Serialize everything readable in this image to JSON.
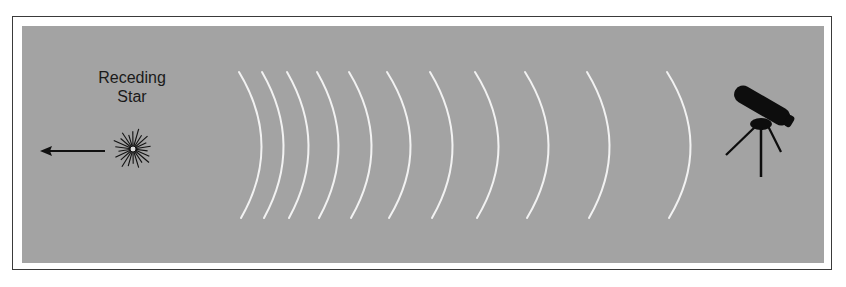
{
  "diagram": {
    "label": {
      "line1": "Receding",
      "line2": "Star"
    },
    "colors": {
      "panel": "#a3a3a3",
      "wave": "#f2f2f2",
      "ink": "#111111",
      "frame": "#3a3a3a"
    },
    "elements": {
      "star": {
        "name": "receding-star",
        "cx": 133,
        "cy": 149,
        "r": 21
      },
      "arrow": {
        "name": "motion-arrow",
        "x1": 105,
        "x2": 40,
        "y": 151,
        "direction": "left"
      },
      "telescope": {
        "name": "observer-telescope"
      }
    },
    "wavefronts": [
      {
        "top_x": 239,
        "bulge_x": 261
      },
      {
        "top_x": 262,
        "bulge_x": 283
      },
      {
        "top_x": 287,
        "bulge_x": 308
      },
      {
        "top_x": 317,
        "bulge_x": 338
      },
      {
        "top_x": 349,
        "bulge_x": 371
      },
      {
        "top_x": 387,
        "bulge_x": 410
      },
      {
        "top_x": 430,
        "bulge_x": 452
      },
      {
        "top_x": 475,
        "bulge_x": 498
      },
      {
        "top_x": 525,
        "bulge_x": 548
      },
      {
        "top_x": 587,
        "bulge_x": 609
      },
      {
        "top_x": 667,
        "bulge_x": 690
      }
    ],
    "wave_y_top": 72,
    "wave_y_bottom": 218
  }
}
